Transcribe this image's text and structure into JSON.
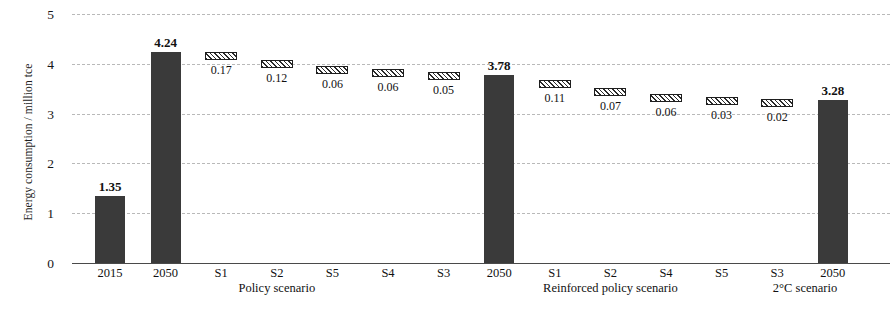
{
  "chart_data": {
    "type": "bar",
    "title": "",
    "xlabel": "",
    "ylabel": "Energy consumption / million tce",
    "ylim": [
      0,
      5
    ],
    "yticks": [
      "0",
      "1",
      "2",
      "3",
      "4",
      "5"
    ],
    "grid": true,
    "legend": "none",
    "categories": [
      "2015",
      "2050",
      "S1",
      "S2",
      "S5",
      "S4",
      "S3",
      "2050",
      "S1",
      "S2",
      "S4",
      "S5",
      "S3",
      "2050"
    ],
    "groups": [
      {
        "label": "Policy scenario",
        "start": 0,
        "end": 6
      },
      {
        "label": "Reinforced policy scenario",
        "start": 6,
        "end": 12
      },
      {
        "label": "2°C scenario",
        "start": 12,
        "end": 13
      }
    ],
    "bars": [
      {
        "category": "2015",
        "label": "1.35",
        "value": 1.35,
        "base": 0,
        "top": 1.35,
        "kind": "total"
      },
      {
        "category": "2050",
        "label": "4.24",
        "value": 4.24,
        "base": 0,
        "top": 4.24,
        "kind": "total"
      },
      {
        "category": "S1",
        "label": "0.17",
        "value": 0.17,
        "base": 4.07,
        "top": 4.24,
        "kind": "delta"
      },
      {
        "category": "S2",
        "label": "0.12",
        "value": 0.12,
        "base": 3.95,
        "top": 4.07,
        "kind": "delta"
      },
      {
        "category": "S5",
        "label": "0.06",
        "value": 0.06,
        "base": 3.89,
        "top": 3.95,
        "kind": "delta"
      },
      {
        "category": "S4",
        "label": "0.06",
        "value": 0.06,
        "base": 3.83,
        "top": 3.89,
        "kind": "delta"
      },
      {
        "category": "S3",
        "label": "0.05",
        "value": 0.05,
        "base": 3.78,
        "top": 3.83,
        "kind": "delta"
      },
      {
        "category": "2050",
        "label": "3.78",
        "value": 3.78,
        "base": 0,
        "top": 3.78,
        "kind": "total"
      },
      {
        "category": "S1",
        "label": "0.11",
        "value": 0.11,
        "base": 3.56,
        "top": 3.67,
        "kind": "delta"
      },
      {
        "category": "S2",
        "label": "0.07",
        "value": 0.07,
        "base": 3.45,
        "top": 3.52,
        "kind": "delta"
      },
      {
        "category": "S4",
        "label": "0.06",
        "value": 0.06,
        "base": 3.33,
        "top": 3.39,
        "kind": "delta"
      },
      {
        "category": "S5",
        "label": "0.03",
        "value": 0.03,
        "base": 3.3,
        "top": 3.33,
        "kind": "delta"
      },
      {
        "category": "S3",
        "label": "0.02",
        "value": 0.02,
        "base": 3.28,
        "top": 3.3,
        "kind": "delta"
      },
      {
        "category": "2050",
        "label": "3.28",
        "value": 3.28,
        "base": 0,
        "top": 3.28,
        "kind": "total"
      }
    ],
    "colors": {
      "total_bar": "#3a3a3a",
      "delta_bar_outline": "#1e1e1e",
      "delta_bar_fill": "#ffffff",
      "gridline": "#b9b9b9",
      "axis": "#4a4a4a",
      "text": "#111111",
      "background": "#ffffff"
    }
  }
}
